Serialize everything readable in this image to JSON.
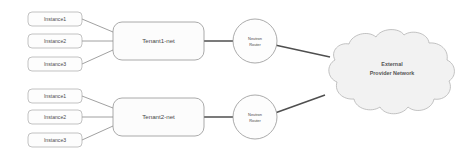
{
  "diagram": {
    "background_color": "#ffffff",
    "colors": {
      "node_fill": "#fdfdfd",
      "node_stroke": "#8f8f8f",
      "cloud_fill": "#f2f2f2",
      "cloud_stroke": "#b4b4b4",
      "link": "#6e6e6e",
      "link_strong": "#4f4f4f",
      "text": "#4a4a4a"
    },
    "tenants": [
      {
        "id": "tenant1",
        "network_label": "Tenant1-net",
        "router_label_line1": "Neutron",
        "router_label_line2": "Router",
        "instances": [
          {
            "label": "Instance1"
          },
          {
            "label": "Instance2"
          },
          {
            "label": "Instance3"
          }
        ]
      },
      {
        "id": "tenant2",
        "network_label": "Tenant2-net",
        "router_label_line1": "Neutron",
        "router_label_line2": "Router",
        "instances": [
          {
            "label": "Instance1"
          },
          {
            "label": "Instance2"
          },
          {
            "label": "Instance3"
          }
        ]
      }
    ],
    "cloud": {
      "label_line1": "External",
      "label_line2": "Provider Network"
    }
  }
}
